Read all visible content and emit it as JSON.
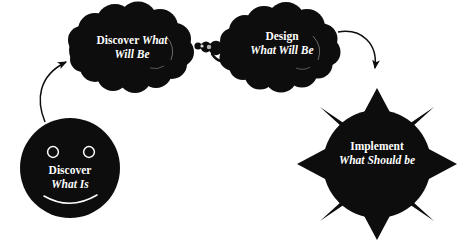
{
  "diagram": {
    "background_color": "#ffffff",
    "shape_color": "#0d0d0d",
    "text_color": "#ffffff",
    "nodes": [
      {
        "id": "discover-what-is",
        "shape": "smiley-face",
        "line1": "Discover",
        "line2": "What Is",
        "line1_style": "roman",
        "line2_style": "italic"
      },
      {
        "id": "discover-what-will-be",
        "shape": "thought-cloud",
        "line1_roman": "Discover ",
        "line1_italic": "What",
        "line2_italic": "Will Be"
      },
      {
        "id": "design-what-will-be",
        "shape": "thought-cloud",
        "line1": "Design",
        "line2": "What Will Be",
        "line1_style": "roman",
        "line2_style": "italic"
      },
      {
        "id": "implement-what-should-be",
        "shape": "sun-burst",
        "line1": "Implement",
        "line2": "What Should be",
        "line1_style": "roman",
        "line2_style": "italic"
      }
    ],
    "connectors": [
      {
        "id": "arrow-face-to-cloud1",
        "type": "curved-arrow",
        "from": "discover-what-is",
        "to": "discover-what-will-be"
      },
      {
        "id": "thought-trail-cloud2-to-cloud1",
        "type": "thought-bubble-trail",
        "from": "design-what-will-be",
        "to": "discover-what-will-be"
      },
      {
        "id": "arrow-cloud2-to-sun",
        "type": "curved-arrow",
        "from": "design-what-will-be",
        "to": "implement-what-should-be"
      }
    ]
  }
}
